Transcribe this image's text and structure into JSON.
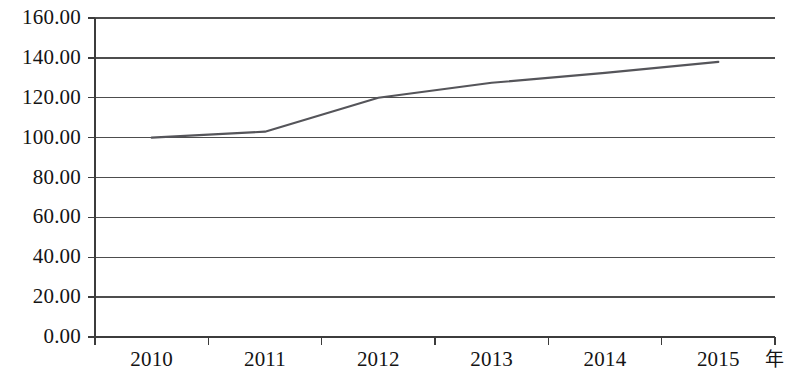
{
  "chart_data": {
    "type": "line",
    "title": "",
    "subtitle": "",
    "xlabel": "年",
    "ylabel": "",
    "categories": [
      "2010",
      "2011",
      "2012",
      "2013",
      "2014",
      "2015"
    ],
    "series": [
      {
        "name": "",
        "values": [
          100.0,
          103.0,
          120.0,
          127.5,
          132.5,
          138.0
        ],
        "color": "#55555a"
      }
    ],
    "ylim": [
      0,
      160
    ],
    "ytick_step": 20,
    "ytick_labels": [
      "0.00",
      "20.00",
      "40.00",
      "60.00",
      "80.00",
      "100.00",
      "120.00",
      "140.00",
      "160.00"
    ],
    "ytick_values": [
      0,
      20,
      40,
      60,
      80,
      100,
      120,
      140,
      160
    ],
    "grid": {
      "horizontal": true,
      "vertical": false,
      "color": "#4d4d4d"
    },
    "legend": {
      "visible": false,
      "position": "none"
    },
    "axis_color": "#3c3c3c",
    "background": "#ffffff"
  }
}
